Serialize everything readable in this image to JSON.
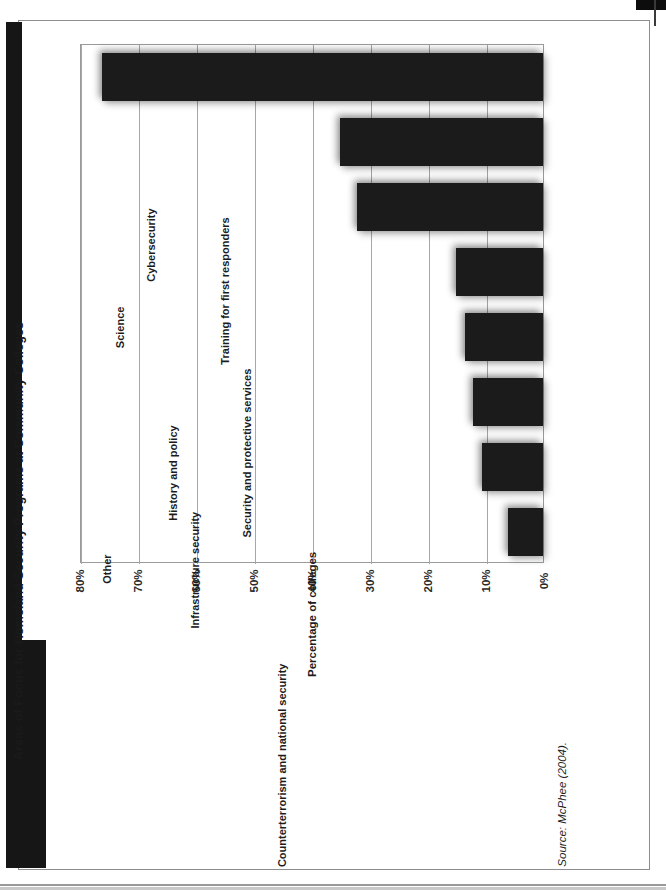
{
  "figure": {
    "number_label": "Figure 1",
    "title": "Areas of Focus for Homeland Security Programs at Community Colleges",
    "source": "Source: McPhee (2004)."
  },
  "chart_data": {
    "type": "bar",
    "orientation": "vertical-bars-on-rotated-page",
    "title": "Areas of Focus for Homeland Security Programs at Community Colleges",
    "xlabel": "",
    "ylabel": "Percentage of colleges",
    "ylim": [
      0,
      80
    ],
    "ytick_labels": [
      "0%",
      "10%",
      "20%",
      "30%",
      "40%",
      "50%",
      "60%",
      "70%",
      "80%"
    ],
    "ytick_values": [
      0,
      10,
      20,
      30,
      40,
      50,
      60,
      70,
      80
    ],
    "grid": true,
    "legend": null,
    "categories": [
      "Training for first responders",
      "Cybersecurity",
      "Security and protective services",
      "Science",
      "History and policy",
      "Infrastructure security",
      "Counterterrorism and national security",
      "Other"
    ],
    "values": [
      76,
      35,
      32,
      15,
      13.5,
      12,
      10.5,
      6
    ]
  }
}
